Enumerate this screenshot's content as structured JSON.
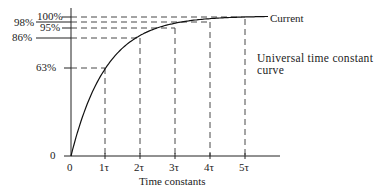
{
  "chart_data": {
    "type": "line",
    "title": "",
    "xlabel": "Time constants",
    "ylabel": "",
    "x_ticks": [
      "0",
      "1τ",
      "2τ",
      "3τ",
      "4τ",
      "5τ"
    ],
    "y_ticks": [
      "0",
      "63%",
      "86%",
      "95%",
      "98%",
      "100%"
    ],
    "x": [
      0,
      1,
      2,
      3,
      4,
      5
    ],
    "series": [
      {
        "name": "Current",
        "values": [
          0,
          63,
          86,
          95,
          98,
          99.3
        ]
      }
    ],
    "ylim": [
      0,
      100
    ],
    "xlim": [
      0,
      6
    ],
    "grid": false,
    "reference_lines": "dashed lines from each y level to corresponding time constant",
    "annotations": [
      {
        "text": "Current",
        "position": "end of curve"
      },
      {
        "text": "Universal time constant",
        "line": 1
      },
      {
        "text": "curve",
        "line": 2
      }
    ]
  },
  "labels": {
    "current": "Current",
    "note_line1": "Universal time constant",
    "note_line2": "curve",
    "xlabel": "Time constants",
    "y0": "0",
    "y63": "63%",
    "y86": "86%",
    "y95": "95%",
    "y98": "98%",
    "y100": "100%",
    "x0": "0",
    "x1": "1τ",
    "x2": "2τ",
    "x3": "3τ",
    "x4": "4τ",
    "x5": "5τ"
  }
}
